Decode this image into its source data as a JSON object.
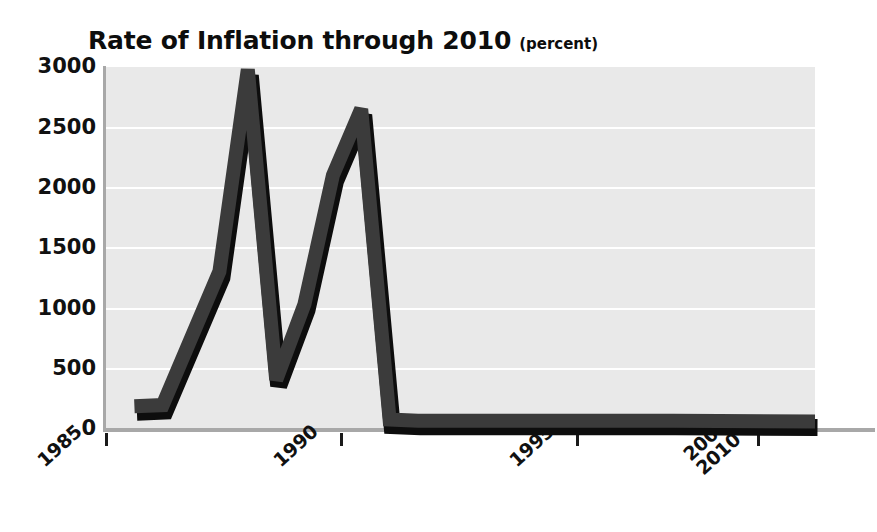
{
  "chart_data": {
    "type": "line",
    "title": "Rate of Inflation through 2010",
    "subtitle": "(percent)",
    "xlabel": "",
    "ylabel": "",
    "ylim": [
      0,
      3000
    ],
    "yticks": [
      0,
      500,
      1000,
      1500,
      2000,
      2500,
      3000
    ],
    "ytick_labels": [
      "0",
      "500",
      "1000",
      "1500",
      "2000",
      "2500",
      "3000"
    ],
    "xtick_labels": [
      "1985",
      "1990",
      "1995",
      "2000-\n2010"
    ],
    "xtick_years": [
      1985,
      1990,
      1995,
      2005
    ],
    "grid": true,
    "legend": false,
    "x": [
      1986,
      1987,
      1989,
      1990,
      1991,
      1992,
      1993,
      1994,
      1995,
      1996,
      1997,
      1998,
      2000,
      2005,
      2010
    ],
    "values": [
      180,
      190,
      1300,
      2980,
      400,
      1030,
      2100,
      2650,
      70,
      60,
      60,
      60,
      60,
      60,
      55
    ],
    "series": [
      {
        "name": "Rate of Inflation",
        "values": [
          180,
          190,
          1300,
          2980,
          400,
          1030,
          2100,
          2650,
          70,
          60,
          60,
          60,
          60,
          60,
          55
        ]
      }
    ],
    "colors": {
      "line": "#3b3b3b",
      "line_shadow": "#0d0d0d",
      "plot_background": "#e9e9e9",
      "gridline": "#ffffff",
      "axis": "#a8a8a8",
      "text": "#111111"
    }
  }
}
